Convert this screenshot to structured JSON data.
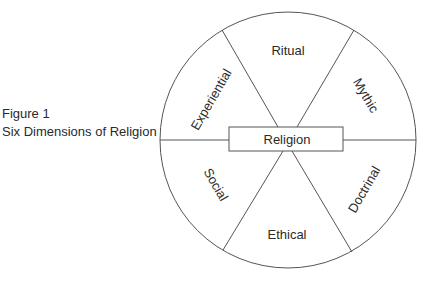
{
  "caption": {
    "figure_label": "Figure 1",
    "title": "Six Dimensions of Religion"
  },
  "diagram": {
    "center_label": "Religion",
    "segments": {
      "top": "Ritual",
      "top_right": "Mythic",
      "bottom_right": "Doctrinal",
      "bottom": "Ethical",
      "bottom_left": "Social",
      "top_left": "Experiential"
    },
    "colors": {
      "stroke": "#555555",
      "text": "#2a2a2a",
      "background": "#ffffff"
    }
  }
}
